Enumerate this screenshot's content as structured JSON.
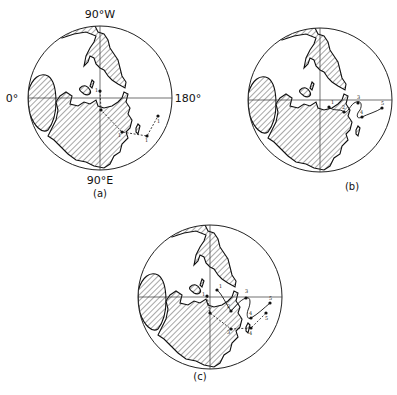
{
  "figure": {
    "panels": [
      {
        "id": "a",
        "caption": "(a)",
        "center": [
          100,
          98
        ],
        "radius": 72,
        "axis_labels": {
          "top": "90°W",
          "left": "0°",
          "right": "180°",
          "bottom": "90°E"
        },
        "tracks": [
          {
            "style": "dashed",
            "points": [
              [
                100,
                91
              ],
              [
                101,
                110
              ],
              [
                122,
                132
              ],
              [
                147,
                136
              ],
              [
                158,
                116
              ]
            ],
            "labels": [
              "1",
              "1",
              "1",
              "1",
              "1"
            ]
          }
        ]
      },
      {
        "id": "b",
        "caption": "(b)",
        "center": [
          320,
          100
        ],
        "radius": 72,
        "axis_labels": {},
        "tracks": [
          {
            "style": "solid",
            "points": [
              [
                329,
                107
              ],
              [
                344,
                112
              ],
              [
                358,
                103
              ],
              [
                362,
                117
              ],
              [
                382,
                108
              ]
            ],
            "labels": [
              "1",
              "2",
              "3",
              "4",
              "5"
            ]
          }
        ]
      },
      {
        "id": "c",
        "caption": "(c)",
        "center": [
          210,
          297
        ],
        "radius": 72,
        "axis_labels": {},
        "tracks": [
          {
            "style": "solid",
            "points": [
              [
                217,
                290
              ],
              [
                231,
                311
              ],
              [
                246,
                298
              ],
              [
                251,
                318
              ],
              [
                270,
                303
              ]
            ],
            "labels": [
              "1",
              "2",
              "3",
              "4",
              "5"
            ]
          },
          {
            "style": "dashed",
            "points": [
              [
                207,
                296
              ],
              [
                210,
                313
              ],
              [
                231,
                329
              ],
              [
                251,
                328
              ],
              [
                266,
                313
              ]
            ],
            "labels": [
              "1",
              "2",
              "3",
              "4",
              "5"
            ]
          }
        ]
      }
    ],
    "legend": {
      "hatched_area": "land-mass",
      "solid_track": "track-solid",
      "dashed_track": "track-dashed"
    }
  }
}
